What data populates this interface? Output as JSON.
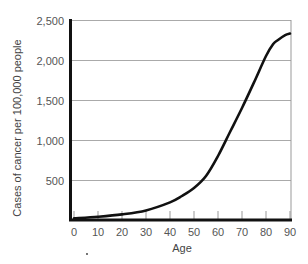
{
  "chart_data": {
    "type": "line",
    "title": "",
    "xlabel": "Age",
    "ylabel": "Cases of cancer per 100,000 people",
    "xlim": [
      0,
      90
    ],
    "ylim": [
      0,
      2500
    ],
    "x_ticks": [
      0,
      10,
      20,
      30,
      40,
      50,
      60,
      70,
      80,
      90
    ],
    "x_tick_labels": [
      "0",
      "10",
      "20",
      "30",
      "40",
      "50",
      "60",
      "70",
      "80",
      "90"
    ],
    "y_ticks": [
      500,
      1000,
      1500,
      2000,
      2500
    ],
    "y_tick_labels": [
      "500",
      "1,000",
      "1,500",
      "2,000",
      "2,500"
    ],
    "grid": "horizontal",
    "legend": "none",
    "series": [
      {
        "name": "Cancer incidence",
        "color": "#111111",
        "x": [
          0,
          10,
          20,
          30,
          40,
          45,
          50,
          55,
          60,
          65,
          70,
          75,
          80,
          83,
          85,
          88,
          90
        ],
        "values": [
          20,
          40,
          70,
          120,
          220,
          300,
          400,
          550,
          800,
          1100,
          1400,
          1720,
          2050,
          2200,
          2250,
          2310,
          2330
        ]
      }
    ]
  }
}
